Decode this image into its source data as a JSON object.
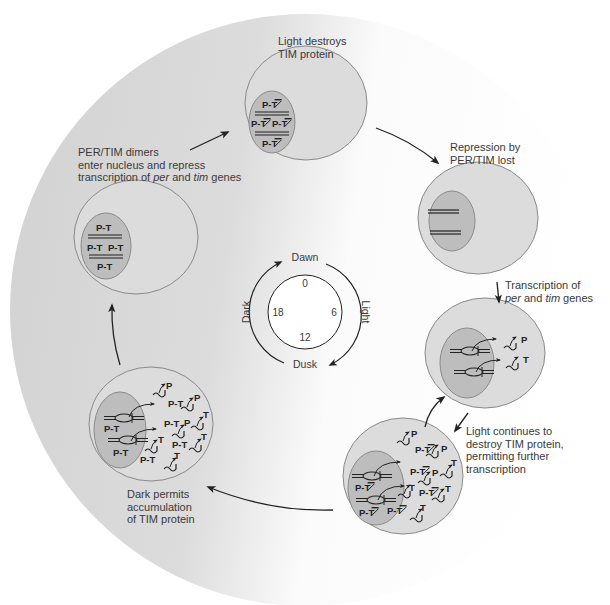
{
  "diagram": {
    "type": "circadian-cycle",
    "colors": {
      "background_dark": "#d7d7d7",
      "background_light": "#ffffff",
      "cell_fill": "#dcdcdc",
      "cell_stroke": "#8a8a8a",
      "nucleus_fill": "#bdbdbd",
      "nucleus_stroke": "#8a8a8a",
      "ink": "#222222",
      "text": "#3a3a3a"
    },
    "clock": {
      "top": "Dawn",
      "bottom": "Dusk",
      "left": "Dark",
      "right": "Light",
      "hours": {
        "h0": "0",
        "h6": "6",
        "h12": "12",
        "h18": "18"
      }
    },
    "stages": [
      {
        "id": "light-destroys-tim",
        "caption_lines": [
          "Light destroys",
          "TIM protein"
        ],
        "nucleus_labels": [
          "P-T̶",
          "P-T̶",
          "P-T̶",
          "P-T̶"
        ]
      },
      {
        "id": "repression-lost",
        "caption_lines": [
          "Repression by",
          "PER/TIM lost"
        ]
      },
      {
        "id": "transcription",
        "caption_line1": "Transcription of",
        "caption_line2_parts": [
          "per",
          " and ",
          "tim",
          " genes"
        ],
        "cytoplasm_labels": [
          "P",
          "T"
        ]
      },
      {
        "id": "light-continues",
        "caption_lines": [
          "Light continues to",
          "destroy TIM protein,",
          "permitting further",
          "transcription"
        ],
        "nucleus_labels": [
          "P-T̶",
          "P-T̶"
        ],
        "cytoplasm_labels": [
          "P",
          "P-T̶",
          "P",
          "P-T̶",
          "P",
          "T",
          "T",
          "P-T̶",
          "T",
          "P-T̶",
          "T"
        ]
      },
      {
        "id": "dark-accumulation",
        "caption_lines": [
          "Dark permits",
          "accumulation",
          "of TIM protein"
        ],
        "nucleus_labels": [
          "P-T",
          "P-T"
        ],
        "cytoplasm_labels": [
          "P",
          "P-T",
          "P",
          "P-T",
          "P",
          "T",
          "T",
          "P-T",
          "T",
          "P-T",
          "T"
        ]
      },
      {
        "id": "dimers-enter-nucleus",
        "caption_line1": "PER/TIM dimers",
        "caption_line2": "enter nucleus and repress",
        "caption_line3_parts": [
          "transcription of ",
          "per",
          " and ",
          "tim",
          " genes"
        ],
        "nucleus_labels": [
          "P-T",
          "P-T",
          "P-T",
          "P-T"
        ]
      }
    ],
    "text": {
      "pt": "P-T",
      "pt_struck_p": "P-",
      "pt_struck_t": "T",
      "p": "P",
      "t": "T"
    }
  }
}
